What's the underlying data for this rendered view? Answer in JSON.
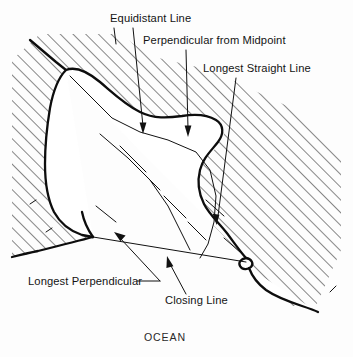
{
  "figure": {
    "caption": "OCEAN",
    "width": 353,
    "height": 357,
    "background_color": "#fdfdfd"
  },
  "colors": {
    "ink": "#0d0d0d",
    "line": "#111111",
    "land_hatch": "#1a1a1a",
    "water_fill": "#ffffff",
    "label_text": "#141414"
  },
  "labels": [
    {
      "id": "equidistant-line",
      "text": "Equidistant Line",
      "x": 110,
      "y": 22,
      "anchor": "start"
    },
    {
      "id": "perpendicular-from-midpoint",
      "text": "Perpendicular from Midpoint",
      "x": 143,
      "y": 44,
      "anchor": "start"
    },
    {
      "id": "longest-straight-line",
      "text": "Longest Straight Line",
      "x": 203,
      "y": 72,
      "anchor": "start"
    },
    {
      "id": "longest-perpendicular",
      "text": "Longest Perpendicular",
      "x": 28,
      "y": 285,
      "anchor": "start"
    },
    {
      "id": "closing-line",
      "text": "Closing Line",
      "x": 165,
      "y": 304,
      "anchor": "start"
    }
  ],
  "caption_label": {
    "id": "ocean",
    "text": "OCEAN",
    "x": 165,
    "y": 341,
    "anchor": "middle"
  },
  "geometry": {
    "land_region": "hatched area surrounding the bay on north, west and east",
    "water_region": "unhatched bay interior opening to the south",
    "closing_line": {
      "from": [
        93,
        237
      ],
      "to": [
        246,
        262
      ],
      "description": "straight line across the mouth of the bay between the two headlands"
    },
    "hatch_angle_degrees": 45,
    "hatch_spacing_px": 9
  }
}
